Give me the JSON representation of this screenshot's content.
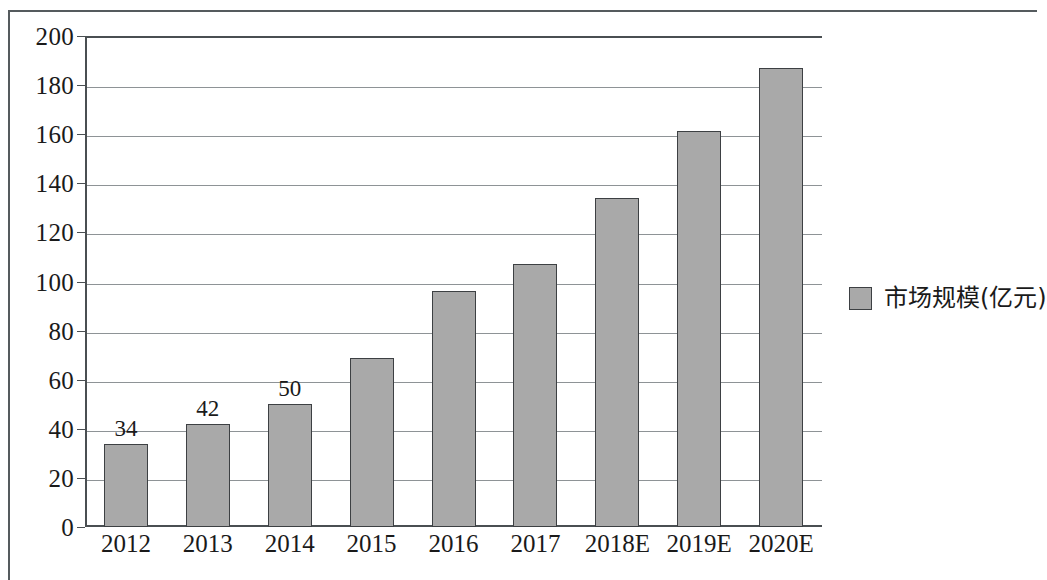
{
  "chart_data": {
    "type": "bar",
    "title": "",
    "xlabel": "",
    "ylabel": "",
    "categories": [
      "2012",
      "2013",
      "2014",
      "2015",
      "2016",
      "2017",
      "2018E",
      "2019E",
      "2020E"
    ],
    "values": [
      34,
      42,
      50,
      69,
      96,
      107,
      134,
      161.5,
      187
    ],
    "data_labels": [
      "34",
      "42",
      "50",
      "",
      "",
      "",
      "",
      "",
      ""
    ],
    "series": [
      {
        "name": "市场规模(亿元)",
        "values": [
          34,
          42,
          50,
          69,
          96,
          107,
          134,
          161.5,
          187
        ]
      }
    ],
    "ylim": [
      0,
      200
    ],
    "ytick_values": [
      0,
      20,
      40,
      60,
      80,
      100,
      120,
      140,
      160,
      180,
      200
    ],
    "ytick_labels": [
      "0",
      "20",
      "40",
      "60",
      "80",
      "100",
      "120",
      "140",
      "160",
      "180",
      "200"
    ],
    "grid": true,
    "grid_axis": "y",
    "legend_position": "right",
    "bar_color": "#a9a9a9",
    "bar_border_color": "#3d4043",
    "grid_color": "#8e9396",
    "axis_color": "#4a4f52",
    "background": "#ffffff"
  },
  "legend": {
    "entries": [
      {
        "label": "市场规模(亿元)",
        "color": "#a9a9a9"
      }
    ]
  },
  "frame": {
    "border_color": "#555b5e"
  }
}
